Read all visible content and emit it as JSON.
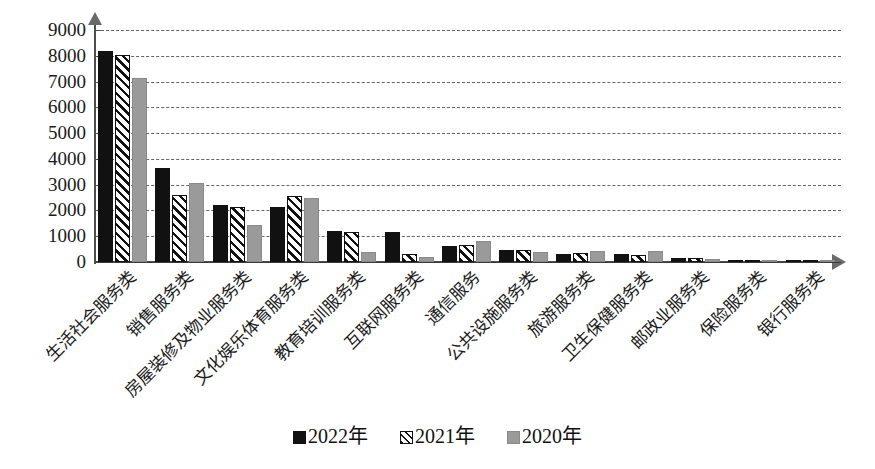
{
  "chart_data": {
    "type": "bar",
    "title": "",
    "subtitle": "",
    "xlabel": "",
    "ylabel": "",
    "ylim": [
      0,
      9000
    ],
    "ytick_step": 1000,
    "yticks": [
      "9000",
      "8000",
      "7000",
      "6000",
      "5000",
      "4000",
      "3000",
      "2000",
      "1000",
      "0"
    ],
    "grid": true,
    "legend_position": "bottom",
    "categories": [
      "生活社会服务类",
      "销售服务类",
      "房屋装修及物业服务类",
      "文化娱乐体育服务类",
      "教育培训服务类",
      "互联网服务类",
      "通信服务",
      "公共设施服务类",
      "旅游服务类",
      "卫生保健服务类",
      "邮政业服务类",
      "保险服务类",
      "银行服务类"
    ],
    "series": [
      {
        "name": "2022年",
        "color": "#111111",
        "pattern": "solid",
        "values": [
          8200,
          3650,
          2200,
          2150,
          1200,
          1150,
          620,
          480,
          330,
          300,
          150,
          80,
          60
        ]
      },
      {
        "name": "2021年",
        "color": "#111111",
        "pattern": "diagonal-hatch",
        "values": [
          8050,
          2600,
          2150,
          2550,
          1150,
          300,
          650,
          480,
          350,
          280,
          160,
          90,
          50
        ]
      },
      {
        "name": "2020年",
        "color": "#9a9a9a",
        "pattern": "solid-gray",
        "values": [
          7150,
          3050,
          1450,
          2500,
          400,
          200,
          800,
          380,
          420,
          430,
          100,
          60,
          40
        ]
      }
    ]
  },
  "legend": {
    "items": [
      {
        "label": "2022年",
        "swatch": "solid-black-square-icon"
      },
      {
        "label": "2021年",
        "swatch": "hatched-square-icon"
      },
      {
        "label": "2020年",
        "swatch": "gray-square-icon"
      }
    ]
  },
  "axes": {
    "y_axis_name": "y-axis",
    "x_axis_name": "x-axis"
  }
}
